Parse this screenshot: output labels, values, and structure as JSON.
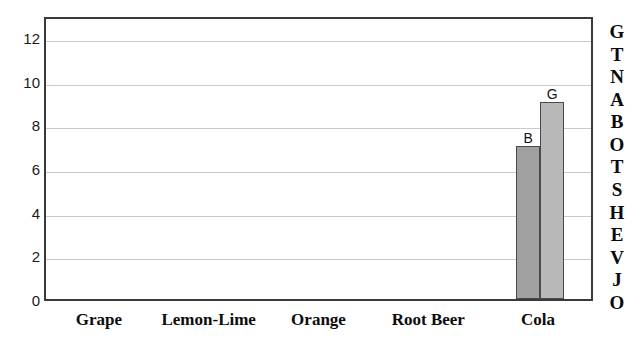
{
  "chart_data": {
    "type": "bar",
    "title": "",
    "subtitle": "",
    "xlabel": "",
    "ylabel": "",
    "categories": [
      "Grape",
      "Lemon-Lime",
      "Orange",
      "Root Beer",
      "Cola"
    ],
    "series": [
      {
        "name": "B",
        "label": "B",
        "color": "#a0a0a0",
        "values": [
          0,
          0,
          0,
          0,
          7
        ]
      },
      {
        "name": "G",
        "label": "G",
        "color": "#b8b8b8",
        "values": [
          0,
          0,
          0,
          0,
          9
        ]
      }
    ],
    "ylim": [
      0,
      13
    ],
    "yticks": [
      0,
      2,
      4,
      6,
      8,
      10,
      12
    ],
    "ytick_labels": [
      "0",
      "2",
      "4",
      "6",
      "8",
      "10",
      "12"
    ],
    "grid": true,
    "grid_axis": "y",
    "legend": "none",
    "bar_value_labels": [
      {
        "text": "B",
        "category": "Cola",
        "value": 7
      },
      {
        "text": "G",
        "category": "Cola",
        "value": 9
      }
    ]
  },
  "annotations": {
    "right_vertical_caption": "GTNABOTSHEVJO",
    "right_vertical_caption_chars": [
      "G",
      "T",
      "N",
      "A",
      "B",
      "O",
      "T",
      "S",
      "H",
      "E",
      "V",
      "J",
      "O"
    ]
  },
  "colors": {
    "plot_border": "#3a3a3a",
    "gridline": "#c9c9c9",
    "background": "#ffffff",
    "bar_b": "#a0a0a0",
    "bar_g": "#b8b8b8",
    "text": "#111111"
  }
}
